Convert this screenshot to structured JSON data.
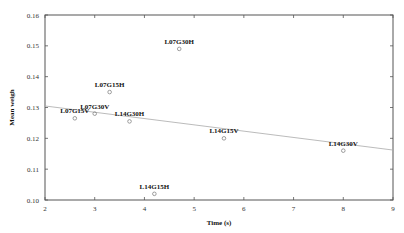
{
  "chart_data": {
    "type": "scatter",
    "title": "",
    "xlabel": "Time (s)",
    "ylabel": "Mean weigh",
    "xlim": [
      2,
      9
    ],
    "ylim": [
      0.1,
      0.16
    ],
    "xticks": [
      2,
      3,
      4,
      5,
      6,
      7,
      8,
      9
    ],
    "yticks": [
      0.1,
      0.11,
      0.12,
      0.13,
      0.14,
      0.15,
      0.16
    ],
    "xtick_labels": [
      "2",
      "3",
      "4",
      "5",
      "6",
      "7",
      "8",
      "9"
    ],
    "ytick_labels": [
      "0.10",
      "0.11",
      "0.12",
      "0.13",
      "0.14",
      "0.15",
      "0.16"
    ],
    "grid": false,
    "legend": null,
    "points": [
      {
        "label": "L07G15V",
        "x": 2.6,
        "y": 0.1265
      },
      {
        "label": "L07G30V",
        "x": 3.0,
        "y": 0.128
      },
      {
        "label": "L07G15H",
        "x": 3.3,
        "y": 0.135
      },
      {
        "label": "L14G30H",
        "x": 3.7,
        "y": 0.1255
      },
      {
        "label": "L14G15H",
        "x": 4.2,
        "y": 0.102
      },
      {
        "label": "L07G30H",
        "x": 4.7,
        "y": 0.149
      },
      {
        "label": "L14G15V",
        "x": 5.6,
        "y": 0.12
      },
      {
        "label": "L14G30V",
        "x": 8.0,
        "y": 0.116
      }
    ],
    "trendline": {
      "x": [
        2,
        9
      ],
      "y": [
        0.1305,
        0.1162
      ]
    }
  }
}
